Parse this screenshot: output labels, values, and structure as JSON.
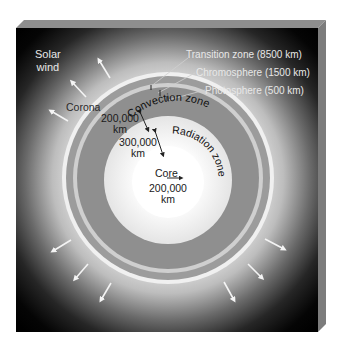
{
  "diagram": {
    "colors": {
      "background_outer": "#000000",
      "corona_glow": "#d8d8d8",
      "photosphere_edge": "#f2f2f2",
      "outer_annulus": "#9a9a9a",
      "thin_light_ring": "#c9c9c9",
      "convection_zone": "#8c8c8c",
      "radiation_zone": "#ebebeb",
      "core": "#ffffff",
      "box_top_bevel": "#8a8a8a",
      "box_right_side": "#7a7a7a",
      "arrow_light": "#f4f4f4",
      "arrow_dark": "#222222"
    },
    "labels": {
      "solar_wind_line1": "Solar",
      "solar_wind_line2": "wind",
      "corona": "Corona",
      "transition_zone": "Transition zone (8500 km)",
      "chromosphere": "Chromosphere (1500 km)",
      "photosphere": "Photosphere (500 km)",
      "convection_zone": "Convection zone",
      "radiation_zone": "Radiation zone",
      "core": "Core",
      "convection_depth_value": "200,000",
      "convection_depth_unit": "km",
      "radiation_depth_value": "300,000",
      "radiation_depth_unit": "km",
      "core_radius_value": "200,000",
      "core_radius_unit": "km"
    },
    "layers": [
      {
        "name": "Core",
        "thickness_km": 200000
      },
      {
        "name": "Radiation zone",
        "thickness_km": 300000
      },
      {
        "name": "Convection zone",
        "thickness_km": 200000
      },
      {
        "name": "Photosphere",
        "thickness_km": 500
      },
      {
        "name": "Chromosphere",
        "thickness_km": 1500
      },
      {
        "name": "Transition zone",
        "thickness_km": 8500
      },
      {
        "name": "Corona",
        "thickness_km": null
      }
    ],
    "solar_wind_arrows": {
      "count": 8,
      "icon": "outward-arrow-icon"
    }
  }
}
